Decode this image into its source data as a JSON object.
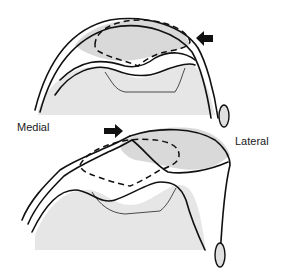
{
  "figure": {
    "labels": {
      "medial": "Medial",
      "lateral": "Lateral"
    },
    "panels": [
      {
        "name": "top-view",
        "arrow_direction": "left"
      },
      {
        "name": "bottom-view",
        "arrow_direction": "right"
      }
    ],
    "colors": {
      "line": "#111111",
      "shading": "#e0e0e0",
      "background": "#ffffff"
    }
  }
}
